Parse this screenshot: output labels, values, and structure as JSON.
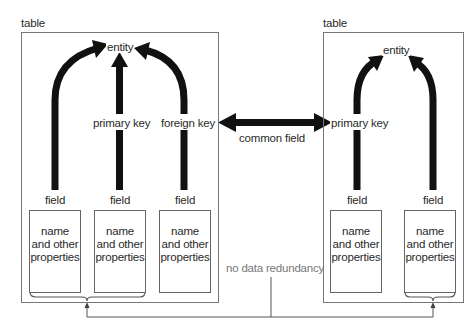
{
  "diagram": {
    "left_table": {
      "label": "table",
      "entity": "entity",
      "primary_key": "primary key",
      "foreign_key": "foreign key",
      "fields": [
        {
          "label": "field",
          "lines": [
            "name",
            "and other",
            "properties"
          ]
        },
        {
          "label": "field",
          "lines": [
            "name",
            "and other",
            "properties"
          ]
        },
        {
          "label": "field",
          "lines": [
            "name",
            "and other",
            "properties"
          ]
        }
      ]
    },
    "right_table": {
      "label": "table",
      "entity": "entity",
      "primary_key": "primary key",
      "fields": [
        {
          "label": "field",
          "lines": [
            "name",
            "and other",
            "properties"
          ]
        },
        {
          "label": "field",
          "lines": [
            "name",
            "and other",
            "properties"
          ]
        }
      ]
    },
    "link_label": "common field",
    "bottom_note": "no data redundancy",
    "colors": {
      "arrow": "#111111",
      "border": "#777777",
      "note_text": "#777777"
    }
  }
}
